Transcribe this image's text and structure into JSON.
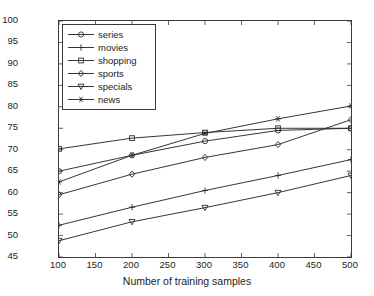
{
  "chart_data": {
    "type": "line",
    "title": "",
    "xlabel": "Number of training samples",
    "ylabel": "F1 value",
    "x": [
      100,
      200,
      300,
      400,
      500
    ],
    "xlim": [
      100,
      500
    ],
    "ylim": [
      45,
      100
    ],
    "xticks": [
      100,
      150,
      200,
      250,
      300,
      350,
      400,
      450,
      500
    ],
    "yticks": [
      45,
      50,
      55,
      60,
      65,
      70,
      75,
      80,
      85,
      90,
      95,
      100
    ],
    "grid": false,
    "legend_position": "upper left",
    "series": [
      {
        "name": "series",
        "marker": "circle",
        "values": [
          65.0,
          68.7,
          72.0,
          74.5,
          75.0
        ],
        "color": "#2b2b2b"
      },
      {
        "name": "movies",
        "marker": "plus",
        "values": [
          52.4,
          56.6,
          60.5,
          64.0,
          67.7
        ],
        "color": "#2b2b2b"
      },
      {
        "name": "shopping",
        "marker": "square",
        "values": [
          70.2,
          72.7,
          74.0,
          75.0,
          75.0
        ],
        "color": "#2b2b2b"
      },
      {
        "name": "sports",
        "marker": "diamond",
        "values": [
          59.5,
          64.3,
          68.2,
          71.2,
          77.0
        ],
        "color": "#2b2b2b"
      },
      {
        "name": "specials",
        "marker": "triangle-down",
        "values": [
          48.8,
          53.2,
          56.5,
          60.0,
          64.0
        ],
        "color": "#2b2b2b"
      },
      {
        "name": "news",
        "marker": "star",
        "values": [
          62.5,
          68.7,
          73.8,
          77.2,
          80.2
        ],
        "color": "#2b2b2b"
      }
    ]
  },
  "axis": {
    "x_tick_labels": [
      "100",
      "150",
      "200",
      "250",
      "300",
      "350",
      "400",
      "450",
      "500"
    ],
    "y_tick_labels": [
      "45",
      "50",
      "55",
      "60",
      "65",
      "70",
      "75",
      "80",
      "85",
      "90",
      "95",
      "100"
    ],
    "x_title": "Number of training samples",
    "y_title": "F1 value"
  },
  "legend": {
    "items": [
      {
        "label": "series"
      },
      {
        "label": "movies"
      },
      {
        "label": "shopping"
      },
      {
        "label": "sports"
      },
      {
        "label": "specials"
      },
      {
        "label": "news"
      }
    ]
  }
}
